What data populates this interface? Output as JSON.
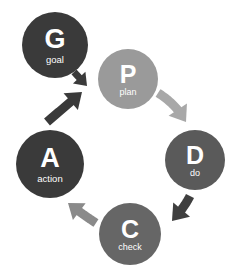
{
  "diagram": {
    "background_color": "#ffffff",
    "width": 246,
    "height": 274,
    "nodes": [
      {
        "id": "goal",
        "letter": "G",
        "caption": "goal",
        "color": "#3a3a3a",
        "cx": 55,
        "cy": 45,
        "r": 33,
        "letter_size": 27,
        "caption_size": 9.5,
        "letter_dy": -4,
        "caption_dy": 15
      },
      {
        "id": "plan",
        "letter": "P",
        "caption": "plan",
        "color": "#9a9a9a",
        "cx": 128,
        "cy": 79,
        "r": 30,
        "letter_size": 25,
        "caption_size": 9,
        "letter_dy": -3,
        "caption_dy": 14
      },
      {
        "id": "do",
        "letter": "D",
        "caption": "do",
        "color": "#5a5a5a",
        "cx": 195,
        "cy": 160,
        "r": 30,
        "letter_size": 25,
        "caption_size": 9,
        "letter_dy": -3,
        "caption_dy": 14
      },
      {
        "id": "check",
        "letter": "C",
        "caption": "check",
        "color": "#666666",
        "cx": 130,
        "cy": 234,
        "r": 31,
        "letter_size": 25,
        "caption_size": 9,
        "letter_dy": -3,
        "caption_dy": 14
      },
      {
        "id": "action",
        "letter": "A",
        "caption": "action",
        "color": "#3a3a3a",
        "cx": 50,
        "cy": 164,
        "r": 34,
        "letter_size": 27,
        "caption_size": 9.5,
        "letter_dy": -4,
        "caption_dy": 15
      }
    ],
    "arrows": [
      {
        "id": "goal-to-plan",
        "from": "goal",
        "to": "plan",
        "color": "#3a3a3a",
        "shape": "M 74,72 L 87,86"
      },
      {
        "id": "action-to-plan",
        "from": "action",
        "to": "plan",
        "color": "#3a3a3a",
        "shape": "M 47,122 L 82,92"
      },
      {
        "id": "plan-to-do",
        "from": "plan",
        "to": "do",
        "color": "#a8a8a8",
        "shape": "M 158,93 Q 176,104 186,122"
      },
      {
        "id": "do-to-check",
        "from": "do",
        "to": "check",
        "color": "#3f3f3f",
        "shape": "M 190,196 Q 184,208 172,221"
      },
      {
        "id": "check-to-action",
        "from": "check",
        "to": "action",
        "color": "#8a8a8a",
        "shape": "M 96,223 Q 82,214 68,203"
      }
    ]
  }
}
